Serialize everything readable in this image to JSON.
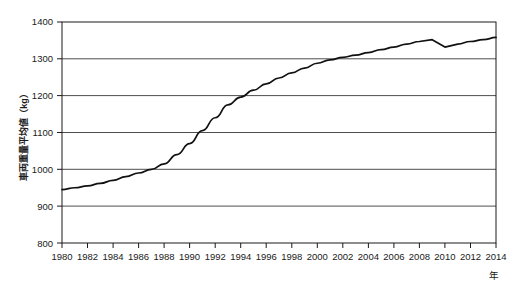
{
  "chart_data": {
    "type": "line",
    "title": "",
    "xlabel": "年",
    "ylabel": "車両重量平均値（kg）",
    "ylabel_unit": "kg",
    "xlim": [
      1980,
      2014
    ],
    "ylim": [
      800,
      1400
    ],
    "y_ticks": [
      800,
      900,
      1000,
      1100,
      1200,
      1300,
      1400
    ],
    "x_ticks": [
      1980,
      1982,
      1984,
      1986,
      1988,
      1990,
      1992,
      1994,
      1996,
      1998,
      2000,
      2002,
      2004,
      2006,
      2008,
      2010,
      2012,
      2014
    ],
    "x_tick_labels": [
      "1980",
      "1982",
      "1984",
      "1986",
      "1988",
      "1990",
      "1992",
      "1994",
      "1996",
      "1998",
      "2000",
      "2002",
      "2004",
      "2006",
      "2008",
      "2010",
      "2012",
      "2014"
    ],
    "y_tick_labels": [
      "800",
      "900",
      "1000",
      "1100",
      "1200",
      "1300",
      "1400"
    ],
    "grid": "horizontal",
    "legend": "none",
    "line_color": "#111111",
    "grid_color": "#3a3a3a",
    "frame_color": "#1a1a1a",
    "series": [
      {
        "name": "車両重量平均値",
        "x": [
          1980,
          1981,
          1982,
          1983,
          1984,
          1985,
          1986,
          1987,
          1988,
          1989,
          1990,
          1991,
          1992,
          1993,
          1994,
          1995,
          1996,
          1997,
          1998,
          1999,
          2000,
          2001,
          2002,
          2003,
          2004,
          2005,
          2006,
          2007,
          2008,
          2009,
          2010,
          2011,
          2012,
          2013,
          2014
        ],
        "values": [
          945,
          950,
          955,
          962,
          970,
          980,
          990,
          1000,
          1015,
          1040,
          1070,
          1105,
          1140,
          1175,
          1196,
          1215,
          1232,
          1248,
          1262,
          1275,
          1288,
          1297,
          1304,
          1310,
          1317,
          1325,
          1332,
          1340,
          1347,
          1352,
          1332,
          1340,
          1347,
          1352,
          1358
        ]
      }
    ]
  },
  "axis": {
    "y_title": "車両重量平均値（kg）",
    "x_title": "年"
  }
}
